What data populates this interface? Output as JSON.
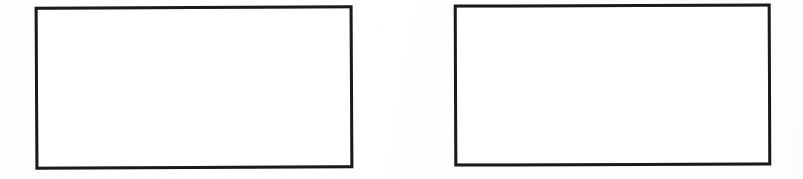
{
  "page": {
    "width": 803,
    "height": 179,
    "background_color": "#fefefe",
    "paper_tone": "#fdfdfc"
  },
  "shapes": [
    {
      "id": "rect-left",
      "name": "empty-rectangle-left",
      "label": "",
      "content": "",
      "stroke_color": "#1a1a18",
      "fill_color": "#ffffff",
      "stroke_width_px": 3,
      "x": 35,
      "y": 6,
      "width": 318,
      "height": 163,
      "rotation_deg": -0.3
    },
    {
      "id": "rect-right",
      "name": "empty-rectangle-right",
      "label": "",
      "content": "",
      "stroke_color": "#1a1a18",
      "fill_color": "#ffffff",
      "stroke_width_px": 3,
      "x": 454,
      "y": 4,
      "width": 317,
      "height": 162,
      "rotation_deg": -0.22
    }
  ]
}
